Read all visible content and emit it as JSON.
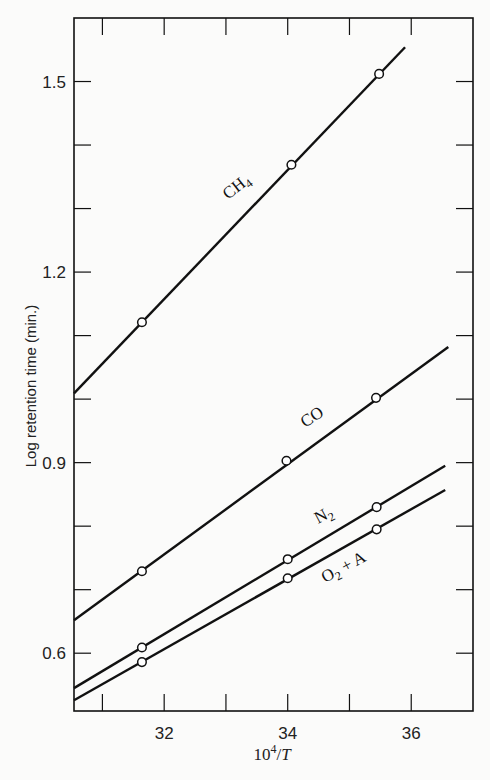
{
  "chart_data": {
    "type": "line",
    "title": "",
    "xlabel": "10^4/T",
    "ylabel": "Log retention time (min.)",
    "xlim": [
      30.54,
      37.0
    ],
    "ylim": [
      0.509,
      1.6
    ],
    "x_ticks": [
      32,
      34,
      36
    ],
    "x_minor_ticks": [
      31,
      33,
      35
    ],
    "x_tick_labels": [
      "32",
      "34",
      "36"
    ],
    "y_ticks": [
      0.6,
      0.9,
      1.2,
      1.5
    ],
    "y_minor_ticks": [
      0.7,
      0.8,
      1.0,
      1.1,
      1.3,
      1.4
    ],
    "y_tick_labels": [
      "0.6",
      "0.9",
      "1.2",
      "1.5"
    ],
    "grid": false,
    "legend": "inline labels on lines",
    "series": [
      {
        "name": "CH4",
        "label_main": "CH",
        "label_sub": "4",
        "points": [
          [
            31.64,
            1.121
          ],
          [
            34.06,
            1.369
          ],
          [
            35.48,
            1.512
          ]
        ],
        "fit_line": [
          [
            30.54,
            1.009
          ],
          [
            35.9,
            1.554
          ]
        ]
      },
      {
        "name": "CO",
        "label_main": "CO",
        "label_sub": "",
        "points": [
          [
            31.64,
            0.729
          ],
          [
            33.98,
            0.903
          ],
          [
            35.43,
            1.002
          ]
        ],
        "fit_line": [
          [
            30.54,
            0.652
          ],
          [
            36.6,
            1.082
          ]
        ]
      },
      {
        "name": "N2",
        "label_main": "N",
        "label_sub": "2",
        "points": [
          [
            31.64,
            0.609
          ],
          [
            34.0,
            0.748
          ],
          [
            35.44,
            0.83
          ]
        ],
        "fit_line": [
          [
            30.54,
            0.545
          ],
          [
            36.55,
            0.895
          ]
        ]
      },
      {
        "name": "O2 + A",
        "label_main": "O",
        "label_sub": "2",
        "label_tail": " + A",
        "points": [
          [
            31.64,
            0.586
          ],
          [
            34.0,
            0.718
          ],
          [
            35.44,
            0.795
          ]
        ],
        "fit_line": [
          [
            30.54,
            0.526
          ],
          [
            36.55,
            0.857
          ]
        ]
      }
    ]
  },
  "colors": {
    "background": "#fbfbfa",
    "ink": "#111111"
  }
}
